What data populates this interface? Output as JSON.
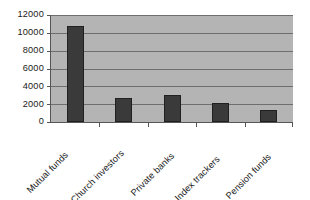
{
  "chart_data": {
    "type": "bar",
    "title": "",
    "subtitle": "",
    "xlabel": "",
    "ylabel": "",
    "categories": [
      "Mutual funds",
      "Church investors",
      "Private banks",
      "Index trackers",
      "Pension funds"
    ],
    "values": [
      10800,
      2650,
      3000,
      2150,
      1300
    ],
    "series": [
      {
        "name": "",
        "values": [
          10800,
          2650,
          3000,
          2150,
          1300
        ]
      }
    ],
    "ylim": [
      0,
      12000
    ],
    "ytick_labels": [
      "0",
      "2000",
      "4000",
      "6000",
      "8000",
      "10000",
      "12000"
    ],
    "ytick_values": [
      0,
      2000,
      4000,
      6000,
      8000,
      10000,
      12000
    ],
    "grid": true,
    "grid_axis": "y",
    "legend": false,
    "legend_position": "none",
    "annotations": [],
    "colors": {
      "bar_fill": "#3a3a3a",
      "bar_border": "#202020",
      "plot_background": "#b4b4b4",
      "gridline": "#6e6e6e",
      "axis_line": "#555555",
      "text": "#1a1a1a",
      "page_background": "#ffffff"
    },
    "xtick_label_rotation": -45
  }
}
